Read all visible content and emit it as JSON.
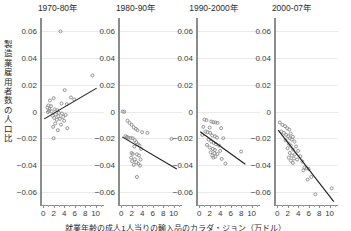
{
  "chart_data": {
    "type": "scatter",
    "title": "",
    "xlabel": "就業年齢の成人1人当りの輸入品のカラダ・ジョン（万ドル）",
    "ylabel": "製造業雇用者数の人口比",
    "xlim": [
      -0.6,
      11.6
    ],
    "ylim": [
      -0.07,
      0.07
    ],
    "xticks": [
      0,
      2,
      4,
      6,
      8,
      10
    ],
    "xtick_labels": [
      "0",
      "2",
      "4",
      "6",
      "8",
      "10"
    ],
    "yticks": [
      0.06,
      0.04,
      0.02,
      0,
      -0.02,
      -0.04,
      -0.06
    ],
    "ytick_labels": [
      "0.06",
      "0.04",
      "0.02",
      "0",
      "−0.02",
      "−0.04",
      "−0.06"
    ],
    "grid": true,
    "grid_axis": "y",
    "legend": "none",
    "marker": "open-circle",
    "marker_color": "#8a8a8a",
    "fit_color": "#1c1c1c",
    "panels": [
      {
        "label": "1970-80年",
        "fit": {
          "x0": 0.2,
          "y0": -0.0055,
          "x1": 10.2,
          "y1": 0.0175
        },
        "points": [
          [
            3.3,
            0.06
          ],
          [
            9.4,
            0.027
          ],
          [
            4.1,
            0.016
          ],
          [
            2.0,
            0.01
          ],
          [
            5.3,
            0.0105
          ],
          [
            5.9,
            0.009
          ],
          [
            1.3,
            0.0082
          ],
          [
            3.5,
            0.006
          ],
          [
            4.5,
            0.0055
          ],
          [
            1.0,
            0.0045
          ],
          [
            1.5,
            0.004
          ],
          [
            0.8,
            0.003
          ],
          [
            1.2,
            0.0018
          ],
          [
            2.2,
            0.0015
          ],
          [
            2.7,
            0.001
          ],
          [
            1.1,
            0.0005
          ],
          [
            1.6,
            0.0
          ],
          [
            0.9,
            -0.0005
          ],
          [
            3.0,
            -0.001
          ],
          [
            3.6,
            -0.0015
          ],
          [
            2.4,
            -0.0022
          ],
          [
            4.3,
            -0.0026
          ],
          [
            1.8,
            -0.003
          ],
          [
            2.9,
            -0.0035
          ],
          [
            3.8,
            -0.004
          ],
          [
            2.1,
            -0.0048
          ],
          [
            3.2,
            -0.0055
          ],
          [
            2.6,
            -0.0062
          ],
          [
            4.0,
            -0.007
          ],
          [
            2.3,
            -0.009
          ],
          [
            3.4,
            -0.0098
          ],
          [
            1.9,
            -0.0115
          ],
          [
            4.6,
            -0.0125
          ],
          [
            2.8,
            -0.014
          ],
          [
            2.0,
            -0.02
          ]
        ]
      },
      {
        "label": "1980-90年",
        "fit": {
          "x0": 0.2,
          "y0": -0.019,
          "x1": 10.6,
          "y1": -0.043
        },
        "points": [
          [
            0.3,
            0.0
          ],
          [
            0.6,
            -0.0002
          ],
          [
            1.2,
            -0.0068
          ],
          [
            1.6,
            -0.0085
          ],
          [
            2.0,
            -0.01
          ],
          [
            2.4,
            -0.0118
          ],
          [
            2.8,
            -0.013
          ],
          [
            3.1,
            -0.014
          ],
          [
            4.0,
            -0.0155
          ],
          [
            5.0,
            -0.016
          ],
          [
            0.8,
            -0.0185
          ],
          [
            1.1,
            -0.019
          ],
          [
            1.4,
            -0.0196
          ],
          [
            1.8,
            -0.0198
          ],
          [
            2.2,
            -0.02
          ],
          [
            9.6,
            -0.0205
          ],
          [
            2.6,
            -0.0215
          ],
          [
            2.9,
            -0.023
          ],
          [
            3.2,
            -0.0245
          ],
          [
            3.5,
            -0.0255
          ],
          [
            2.5,
            -0.0262
          ],
          [
            3.8,
            -0.028
          ],
          [
            2.0,
            -0.031
          ],
          [
            2.2,
            -0.0318
          ],
          [
            3.0,
            -0.032
          ],
          [
            3.4,
            -0.033
          ],
          [
            1.9,
            -0.0345
          ],
          [
            2.6,
            -0.0358
          ],
          [
            3.7,
            -0.036
          ],
          [
            2.1,
            -0.0372
          ],
          [
            2.9,
            -0.038
          ],
          [
            3.3,
            -0.0392
          ],
          [
            2.4,
            -0.04
          ],
          [
            3.6,
            -0.0405
          ],
          [
            3.0,
            -0.049
          ]
        ]
      },
      {
        "label": "1990-2000年",
        "fit": {
          "x0": 0.2,
          "y0": -0.0152,
          "x1": 8.8,
          "y1": -0.0395
        },
        "points": [
          [
            1.0,
            -0.006
          ],
          [
            1.4,
            -0.0065
          ],
          [
            2.3,
            -0.0075
          ],
          [
            2.7,
            -0.008
          ],
          [
            3.1,
            -0.0082
          ],
          [
            3.5,
            -0.0085
          ],
          [
            0.8,
            -0.0115
          ],
          [
            2.0,
            -0.012
          ],
          [
            4.2,
            -0.0125
          ],
          [
            1.2,
            -0.015
          ],
          [
            1.6,
            -0.0155
          ],
          [
            2.1,
            -0.016
          ],
          [
            0.6,
            -0.0175
          ],
          [
            2.5,
            -0.018
          ],
          [
            3.0,
            -0.0185
          ],
          [
            3.4,
            -0.0195
          ],
          [
            4.6,
            -0.02
          ],
          [
            1.8,
            -0.021
          ],
          [
            2.3,
            -0.0225
          ],
          [
            2.8,
            -0.0235
          ],
          [
            3.2,
            -0.0245
          ],
          [
            1.5,
            -0.025
          ],
          [
            3.8,
            -0.0255
          ],
          [
            2.0,
            -0.027
          ],
          [
            2.6,
            -0.028
          ],
          [
            3.0,
            -0.0288
          ],
          [
            4.0,
            -0.0295
          ],
          [
            2.2,
            -0.0305
          ],
          [
            2.9,
            -0.0312
          ],
          [
            3.5,
            -0.0318
          ],
          [
            2.5,
            -0.033
          ],
          [
            3.1,
            -0.0338
          ],
          [
            2.7,
            -0.0345
          ],
          [
            4.3,
            -0.0355
          ],
          [
            5.0,
            -0.039
          ],
          [
            8.0,
            -0.03
          ]
        ]
      },
      {
        "label": "2000-07年",
        "fit": {
          "x0": 0.2,
          "y0": -0.014,
          "x1": 10.8,
          "y1": -0.0675
        },
        "points": [
          [
            0.5,
            -0.0082
          ],
          [
            1.0,
            -0.01
          ],
          [
            1.5,
            -0.011
          ],
          [
            1.9,
            -0.0125
          ],
          [
            2.3,
            -0.0135
          ],
          [
            0.8,
            -0.015
          ],
          [
            1.3,
            -0.016
          ],
          [
            2.6,
            -0.0165
          ],
          [
            1.7,
            -0.0175
          ],
          [
            2.1,
            -0.0185
          ],
          [
            3.0,
            -0.019
          ],
          [
            2.4,
            -0.02
          ],
          [
            2.8,
            -0.021
          ],
          [
            1.6,
            -0.0215
          ],
          [
            3.3,
            -0.0225
          ],
          [
            2.2,
            -0.024
          ],
          [
            2.6,
            -0.0255
          ],
          [
            3.6,
            -0.0262
          ],
          [
            2.0,
            -0.0275
          ],
          [
            3.0,
            -0.0285
          ],
          [
            4.0,
            -0.0295
          ],
          [
            2.4,
            -0.031
          ],
          [
            3.4,
            -0.032
          ],
          [
            2.8,
            -0.033
          ],
          [
            4.4,
            -0.0335
          ],
          [
            2.2,
            -0.0345
          ],
          [
            3.2,
            -0.0352
          ],
          [
            3.8,
            -0.036
          ],
          [
            2.6,
            -0.0368
          ],
          [
            4.8,
            -0.0375
          ],
          [
            3.0,
            -0.0385
          ],
          [
            5.2,
            -0.042
          ],
          [
            5.6,
            -0.0425
          ],
          [
            6.0,
            -0.043
          ],
          [
            5.0,
            -0.044
          ],
          [
            6.5,
            -0.049
          ],
          [
            5.8,
            -0.051
          ],
          [
            10.4,
            -0.0575
          ],
          [
            7.3,
            -0.062
          ]
        ]
      }
    ]
  }
}
